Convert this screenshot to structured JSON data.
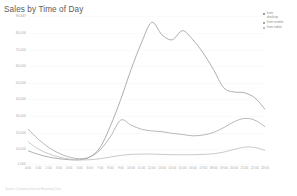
{
  "chart": {
    "title": "Sales by Time of Day",
    "footer_note": "Source: Company Internal Reporting Data"
  },
  "legend": {
    "position": "top-right",
    "items": [
      {
        "label": "from\ndesktop",
        "color": "#999999",
        "name": "legend-item-desktop"
      },
      {
        "label": "from mobile",
        "color": "#a5a5a5",
        "name": "legend-item-mobile"
      },
      {
        "label": "from tablet",
        "color": "#bdbdbd",
        "name": "legend-item-tablet"
      }
    ]
  },
  "chart_data": {
    "type": "line",
    "title": "Sales by Time of Day",
    "xlabel": "",
    "ylabel": "",
    "grid": true,
    "legend_position": "top-right",
    "ylim": [
      1000,
      90347
    ],
    "ytick_labels": [
      "90,347",
      "80,000",
      "70,000",
      "60,000",
      "50,000",
      "40,000",
      "30,000",
      "20,000",
      "10,000",
      "1,000"
    ],
    "ytick_values": [
      90347,
      80000,
      70000,
      60000,
      50000,
      40000,
      30000,
      20000,
      10000,
      1000
    ],
    "categories": [
      "0:00",
      "1:00",
      "2:00",
      "3:00",
      "4:00",
      "5:00",
      "6:00",
      "7:00",
      "8:00",
      "9:00",
      "10:00",
      "11:00",
      "12:00",
      "13:00",
      "14:00",
      "15:00",
      "16:00",
      "17:00",
      "18:00",
      "19:00",
      "20:00",
      "21:00",
      "22:00",
      "23:00"
    ],
    "series": [
      {
        "name": "from desktop",
        "color": "#999999",
        "values": [
          9000,
          6800,
          5200,
          4200,
          3600,
          3500,
          5200,
          11000,
          24000,
          40000,
          58000,
          74000,
          86500,
          79000,
          76000,
          81500,
          76000,
          68000,
          58000,
          47000,
          44500,
          44000,
          41000,
          34000
        ]
      },
      {
        "name": "from mobile",
        "color": "#a5a5a5",
        "values": [
          22000,
          16000,
          11000,
          7500,
          5200,
          4200,
          5200,
          9500,
          17500,
          27500,
          24500,
          22000,
          21000,
          20500,
          19500,
          18800,
          18000,
          18500,
          20000,
          23000,
          26500,
          28500,
          27500,
          23500
        ]
      },
      {
        "name": "from tablet",
        "color": "#bdbdbd",
        "values": [
          14500,
          10000,
          7200,
          5200,
          4000,
          3500,
          3600,
          4200,
          5200,
          6200,
          6800,
          7000,
          7000,
          6800,
          6600,
          6600,
          6600,
          6800,
          7200,
          8200,
          9800,
          11200,
          11000,
          9200
        ]
      }
    ]
  }
}
